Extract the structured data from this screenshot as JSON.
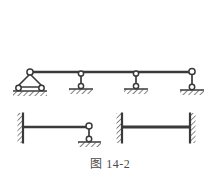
{
  "figure": {
    "caption_label": "图",
    "caption_number": "14-2",
    "caption_full": "图 14-2",
    "background_color": "#ffffff",
    "line_color": "#3a3a3a",
    "hatch_color": "#4a4a4a",
    "node_fill": "#ffffff"
  },
  "diagrams": [
    {
      "id": "upper-beam",
      "name": "continuous-beam-four-supports",
      "beam": {
        "x1": 30,
        "x2": 192,
        "y": 72,
        "thickness": 2.2
      },
      "supports": [
        {
          "id": "support-1",
          "type": "triangle-pin-on-rollers",
          "x": 30,
          "top_y": 72,
          "base_y": 88,
          "half_width": 16,
          "ground_y": 91,
          "rollers": 2,
          "label": "A"
        },
        {
          "id": "support-2",
          "type": "vertical-link-roller",
          "x": 81,
          "top_y": 73,
          "bottom_y": 87,
          "ground_y": 89,
          "label": "B"
        },
        {
          "id": "support-3",
          "type": "vertical-link-roller",
          "x": 136,
          "top_y": 73,
          "bottom_y": 87,
          "ground_y": 89,
          "label": "C"
        },
        {
          "id": "support-4",
          "type": "vertical-link-roller-end",
          "x": 192,
          "top_y": 72,
          "bottom_y": 88,
          "ground_y": 90,
          "label": "D"
        }
      ]
    },
    {
      "id": "lower-left-beam",
      "name": "cantilever-with-end-link-support",
      "beam": {
        "x1": 23,
        "x2": 89,
        "y": 127,
        "thickness": 2.2
      },
      "supports": [
        {
          "id": "support-5",
          "type": "fixed-wall-left",
          "x": 23,
          "y1": 113,
          "y2": 143,
          "hatch_side": "left",
          "label": "E"
        },
        {
          "id": "support-6",
          "type": "vertical-link-roller",
          "x": 89,
          "top_y": 127,
          "bottom_y": 140,
          "ground_y": 142,
          "label": "F"
        }
      ]
    },
    {
      "id": "lower-right-beam",
      "name": "fixed-fixed-beam",
      "beam": {
        "x1": 122,
        "x2": 190,
        "y": 127,
        "thickness": 2.6
      },
      "supports": [
        {
          "id": "support-7",
          "type": "fixed-wall-left",
          "x": 122,
          "y1": 113,
          "y2": 143,
          "hatch_side": "left",
          "label": "G"
        },
        {
          "id": "support-8",
          "type": "fixed-wall-right",
          "x": 190,
          "y1": 113,
          "y2": 143,
          "hatch_side": "right",
          "label": "H"
        }
      ]
    }
  ]
}
